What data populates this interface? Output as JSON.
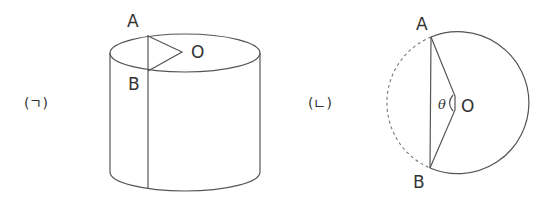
{
  "figures": [
    {
      "id": "a",
      "caption": "(ㄱ)",
      "description": "cylinder with chord AB on top face and triangle AOB",
      "labels": {
        "A": "A",
        "B": "B",
        "O": "O"
      }
    },
    {
      "id": "b",
      "caption": "(ㄴ)",
      "description": "circle cross-section with chord AB and central angle θ at O; minor arc dashed",
      "labels": {
        "A": "A",
        "B": "B",
        "O": "O",
        "angle": "θ"
      }
    }
  ],
  "colors": {
    "line": "#555555",
    "text": "#333333",
    "background": "#ffffff"
  }
}
